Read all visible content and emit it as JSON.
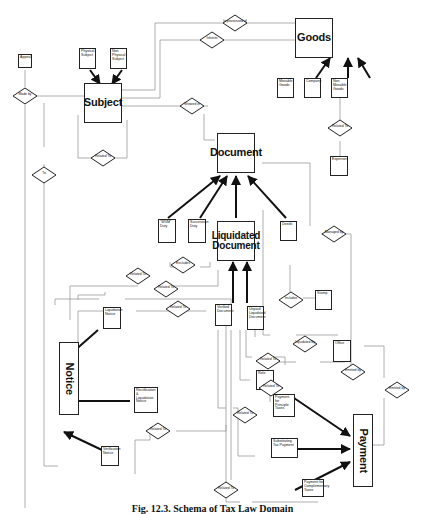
{
  "diagram": {
    "type": "entity-relationship schema",
    "caption": "Fig. 12.3. Schema of Tax Law Domain",
    "entities": {
      "subject": "Subject",
      "physical_subject": "Physical Subject",
      "non_physical_subject": "Non Physical Subject",
      "appeal": "Appeal",
      "goods": "Goods",
      "movable_goods": "Movable Goods",
      "company": "Company",
      "non_movable_goods": "Non Movable Goods",
      "expenses": "Expenses",
      "document": "Document",
      "ww_duty": "\"WVM\" Duty",
      "succession_duty": "Succession Duty",
      "liquidated_document": "Liquidated Document",
      "deeds": "Deeds",
      "stamp": "Stamp",
      "office": "Office",
      "liquidation_notice": "Liquidation Notice",
      "rectification_liquidation_notice": "Rectification & Liquidation Notice",
      "verification_notice": "Verification Notice",
      "verified_document": "Verified Document",
      "unpaid_liquidated_document": "Unpaid Liquidated Document",
      "role": "Role",
      "payment_principle_taxes": "Payment for Principle Taxes",
      "substituting_tax_payment": "Substituting Tax Payment",
      "payment_complementary_taxes": "Payment for Complementary Taxes",
      "notice": "Notice",
      "payment": "Payment"
    },
    "relationships": {
      "is_possessed_of": "Is possessed of",
      "inherits": "Inherits",
      "made_by": "Made by",
      "showed_in": "Showed in",
      "related_to_subject": "Related To",
      "to": "To",
      "related_to_goods": "Related To",
      "excludes": "Excludes",
      "managed_by": "Managed by",
      "includes": "Includes",
      "liquidated_by": "Liquidated By",
      "emitted_by_role": "Emitted by",
      "emitted_by_payment": "Emitted by",
      "related_to_1": "Related To",
      "related_to_2": "Related To",
      "related_to_3": "Related To",
      "related_to_4": "Related To",
      "related_to_5": "Related To",
      "related_to_6": "Related To",
      "related_to_7": "Related To",
      "related_to_8": "Related To"
    }
  }
}
